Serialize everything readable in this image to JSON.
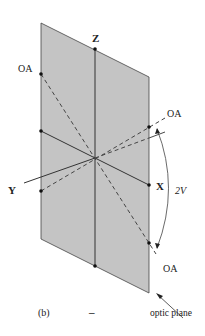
{
  "figure": {
    "panel_label": "(b)",
    "sign": "–",
    "plane_label": "optic plane",
    "colors": {
      "plane_fill": "#c4c4c4",
      "line": "#333333",
      "background": "#ffffff"
    }
  },
  "axes": {
    "x_label": "X",
    "y_label": "Y",
    "z_label": "Z"
  },
  "optic_axes": {
    "upper_left_label": "OA",
    "upper_right_label": "OA",
    "lower_right_label": "OA"
  },
  "angle": {
    "label": "2V"
  }
}
